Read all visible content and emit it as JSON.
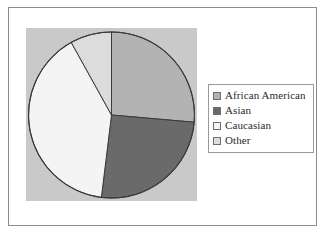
{
  "figure": {
    "background_color": "#ffffff",
    "frame_color": "#8d8d8d",
    "panel_color": "#c9c9c9",
    "pie_outline_color": "#3a3a3a"
  },
  "legend": {
    "position": "right",
    "border_color": "#9a9a9a",
    "background_color": "#ffffff",
    "entries": [
      {
        "label": "African American",
        "color": "#b3b3b3"
      },
      {
        "label": "Asian",
        "color": "#6a6a6a"
      },
      {
        "label": "Caucasian",
        "color": "#f4f4f4"
      },
      {
        "label": "Other",
        "color": "#dcdcdc"
      }
    ]
  },
  "chart_data": {
    "type": "pie",
    "title": "",
    "xlabel": "",
    "ylabel": "",
    "labels": [
      "African American",
      "Asian",
      "Caucasian",
      "Other"
    ],
    "values": [
      26,
      26,
      40,
      8
    ],
    "unit": "percent",
    "start_angle_deg": 0,
    "direction": "clockwise",
    "colors": [
      "#b3b3b3",
      "#6a6a6a",
      "#f4f4f4",
      "#dcdcdc"
    ],
    "slice_angles_deg": [
      {
        "label": "African American",
        "start": 0,
        "end": 95
      },
      {
        "label": "Asian",
        "start": 95,
        "end": 187
      },
      {
        "label": "Caucasian",
        "start": 187,
        "end": 331
      },
      {
        "label": "Other",
        "start": 331,
        "end": 360
      }
    ],
    "legend_position": "right",
    "grid": false,
    "data_labels_shown": false
  }
}
